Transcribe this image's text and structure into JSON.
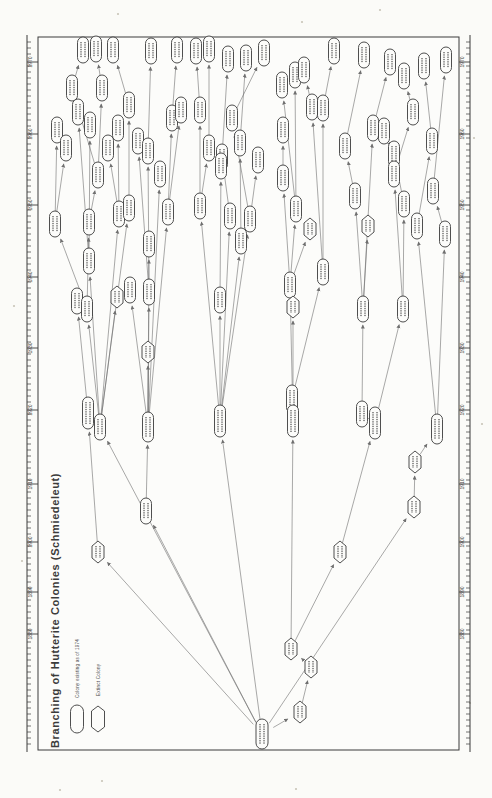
{
  "title": "Branching of Hutterite Colonies (Schmiedeleut)",
  "legend": {
    "existing": "Colony existing as of 1974",
    "extinct": "Extinct Colony"
  },
  "note": "Scanned genealogy diagram; colony names inside nodes are below legibility at this scan resolution and are rendered as micro-text marks.",
  "colors": {
    "ink": "#3b3b3b",
    "line": "#6f6f6f",
    "paper": "#fcfcfa",
    "page": "#fbfbf8",
    "speck": "#c9c5b8",
    "microtext": "#2a2a2a"
  },
  "frame": {
    "top": 37,
    "bottom": 750,
    "inner_left": 38,
    "inner_right": 459,
    "outer_left": 27,
    "outer_right": 470
  },
  "axis": {
    "minor_tick_step": 6,
    "years": [
      {
        "label": "1970",
        "y": 62
      },
      {
        "label": "1960",
        "y": 134
      },
      {
        "label": "1950",
        "y": 205
      },
      {
        "label": "1940",
        "y": 277
      },
      {
        "label": "1930",
        "y": 348
      },
      {
        "label": "1920",
        "y": 410
      },
      {
        "label": "1910",
        "y": 484
      },
      {
        "label": "1900",
        "y": 542
      },
      {
        "label": "1890",
        "y": 592
      },
      {
        "label": "1880",
        "y": 634
      }
    ]
  },
  "legend_shapes": [
    {
      "shape": "p",
      "x": 77,
      "y": 719,
      "w": 13,
      "h": 28
    },
    {
      "shape": "x",
      "x": 98,
      "y": 719,
      "w": 13,
      "h": 26
    }
  ],
  "nodes": [
    {
      "id": 1,
      "x": 83,
      "y": 50,
      "s": "p"
    },
    {
      "id": 2,
      "x": 96,
      "y": 49,
      "s": "p"
    },
    {
      "id": 3,
      "x": 113,
      "y": 50,
      "s": "p"
    },
    {
      "id": 4,
      "x": 151,
      "y": 51,
      "s": "p"
    },
    {
      "id": 5,
      "x": 177,
      "y": 50,
      "s": "p"
    },
    {
      "id": 6,
      "x": 196,
      "y": 51,
      "s": "p"
    },
    {
      "id": 7,
      "x": 209,
      "y": 49,
      "s": "p"
    },
    {
      "id": 8,
      "x": 228,
      "y": 59,
      "s": "p"
    },
    {
      "id": 9,
      "x": 246,
      "y": 58,
      "s": "p"
    },
    {
      "id": 10,
      "x": 264,
      "y": 53,
      "s": "p"
    },
    {
      "id": 11,
      "x": 334,
      "y": 51,
      "s": "p"
    },
    {
      "id": 12,
      "x": 364,
      "y": 55,
      "s": "p"
    },
    {
      "id": 13,
      "x": 390,
      "y": 62,
      "s": "p"
    },
    {
      "id": 14,
      "x": 446,
      "y": 60,
      "s": "p"
    },
    {
      "id": 15,
      "x": 424,
      "y": 66,
      "s": "p"
    },
    {
      "id": 16,
      "x": 404,
      "y": 76,
      "s": "p"
    },
    {
      "id": 17,
      "x": 72,
      "y": 88,
      "s": "p"
    },
    {
      "id": 18,
      "x": 102,
      "y": 88,
      "s": "p"
    },
    {
      "id": 19,
      "x": 78,
      "y": 112,
      "s": "p"
    },
    {
      "id": 20,
      "x": 90,
      "y": 125,
      "s": "p"
    },
    {
      "id": 21,
      "x": 57,
      "y": 130,
      "s": "p"
    },
    {
      "id": 22,
      "x": 66,
      "y": 148,
      "s": "p"
    },
    {
      "id": 23,
      "x": 129,
      "y": 105,
      "s": "p"
    },
    {
      "id": 24,
      "x": 118,
      "y": 128,
      "s": "p"
    },
    {
      "id": 25,
      "x": 108,
      "y": 148,
      "s": "p"
    },
    {
      "id": 26,
      "x": 138,
      "y": 141,
      "s": "p"
    },
    {
      "id": 27,
      "x": 148,
      "y": 151,
      "s": "p"
    },
    {
      "id": 28,
      "x": 172,
      "y": 118,
      "s": "p"
    },
    {
      "id": 29,
      "x": 181,
      "y": 110,
      "s": "p"
    },
    {
      "id": 30,
      "x": 200,
      "y": 110,
      "s": "p"
    },
    {
      "id": 31,
      "x": 209,
      "y": 148,
      "s": "p"
    },
    {
      "id": 32,
      "x": 222,
      "y": 157,
      "s": "p"
    },
    {
      "id": 33,
      "x": 232,
      "y": 118,
      "s": "p"
    },
    {
      "id": 34,
      "x": 240,
      "y": 143,
      "s": "p"
    },
    {
      "id": 35,
      "x": 282,
      "y": 85,
      "s": "p"
    },
    {
      "id": 36,
      "x": 295,
      "y": 75,
      "s": "p"
    },
    {
      "id": 37,
      "x": 304,
      "y": 70,
      "s": "p"
    },
    {
      "id": 38,
      "x": 312,
      "y": 107,
      "s": "p"
    },
    {
      "id": 39,
      "x": 323,
      "y": 108,
      "s": "p"
    },
    {
      "id": 40,
      "x": 283,
      "y": 130,
      "s": "p"
    },
    {
      "id": 41,
      "x": 345,
      "y": 146,
      "s": "p"
    },
    {
      "id": 42,
      "x": 373,
      "y": 128,
      "s": "p"
    },
    {
      "id": 43,
      "x": 384,
      "y": 131,
      "s": "p"
    },
    {
      "id": 44,
      "x": 394,
      "y": 154,
      "s": "p"
    },
    {
      "id": 45,
      "x": 413,
      "y": 112,
      "s": "p"
    },
    {
      "id": 46,
      "x": 432,
      "y": 141,
      "s": "p"
    },
    {
      "id": 47,
      "x": 98,
      "y": 175,
      "s": "p"
    },
    {
      "id": 48,
      "x": 160,
      "y": 174,
      "s": "p"
    },
    {
      "id": 49,
      "x": 221,
      "y": 166,
      "s": "p"
    },
    {
      "id": 50,
      "x": 55,
      "y": 224,
      "s": "p"
    },
    {
      "id": 51,
      "x": 89,
      "y": 222,
      "s": "p"
    },
    {
      "id": 52,
      "x": 119,
      "y": 214,
      "s": "p"
    },
    {
      "id": 53,
      "x": 129,
      "y": 208,
      "s": "p"
    },
    {
      "id": 54,
      "x": 168,
      "y": 212,
      "s": "p"
    },
    {
      "id": 55,
      "x": 200,
      "y": 206,
      "s": "p"
    },
    {
      "id": 56,
      "x": 230,
      "y": 216,
      "s": "p"
    },
    {
      "id": 57,
      "x": 250,
      "y": 219,
      "s": "p"
    },
    {
      "id": 58,
      "x": 241,
      "y": 241,
      "s": "p"
    },
    {
      "id": 59,
      "x": 149,
      "y": 244,
      "s": "p"
    },
    {
      "id": 60,
      "x": 89,
      "y": 261,
      "s": "p"
    },
    {
      "id": 61,
      "x": 258,
      "y": 160,
      "s": "p"
    },
    {
      "id": 62,
      "x": 283,
      "y": 178,
      "s": "p"
    },
    {
      "id": 63,
      "x": 296,
      "y": 209,
      "s": "p"
    },
    {
      "id": 64,
      "x": 310,
      "y": 229,
      "s": "x"
    },
    {
      "id": 65,
      "x": 355,
      "y": 196,
      "s": "p"
    },
    {
      "id": 66,
      "x": 368,
      "y": 226,
      "s": "x"
    },
    {
      "id": 67,
      "x": 394,
      "y": 174,
      "s": "p"
    },
    {
      "id": 68,
      "x": 404,
      "y": 204,
      "s": "p"
    },
    {
      "id": 69,
      "x": 417,
      "y": 226,
      "s": "p"
    },
    {
      "id": 70,
      "x": 433,
      "y": 191,
      "s": "p"
    },
    {
      "id": 71,
      "x": 445,
      "y": 234,
      "s": "p"
    },
    {
      "id": 72,
      "x": 77,
      "y": 301,
      "s": "p"
    },
    {
      "id": 73,
      "x": 87,
      "y": 309,
      "s": "p"
    },
    {
      "id": 74,
      "x": 117,
      "y": 297,
      "s": "x"
    },
    {
      "id": 75,
      "x": 130,
      "y": 290,
      "s": "p"
    },
    {
      "id": 76,
      "x": 149,
      "y": 292,
      "s": "p"
    },
    {
      "id": 77,
      "x": 220,
      "y": 300,
      "s": "p"
    },
    {
      "id": 78,
      "x": 290,
      "y": 285,
      "s": "p"
    },
    {
      "id": 79,
      "x": 293,
      "y": 307,
      "s": "x"
    },
    {
      "id": 80,
      "x": 323,
      "y": 272,
      "s": "p"
    },
    {
      "id": 81,
      "x": 363,
      "y": 309,
      "s": "p"
    },
    {
      "id": 82,
      "x": 403,
      "y": 309,
      "s": "p"
    },
    {
      "id": 83,
      "x": 148,
      "y": 352,
      "s": "x"
    },
    {
      "id": 85,
      "x": 292,
      "y": 399,
      "s": "p",
      "h": 28
    },
    {
      "id": 86,
      "x": 293,
      "y": 421,
      "s": "p",
      "h": 32
    },
    {
      "id": 87,
      "x": 88,
      "y": 413,
      "s": "p",
      "h": 32
    },
    {
      "id": 88,
      "x": 100,
      "y": 427,
      "s": "p"
    },
    {
      "id": 89,
      "x": 148,
      "y": 427,
      "s": "p",
      "h": 30
    },
    {
      "id": 90,
      "x": 220,
      "y": 421,
      "s": "p",
      "h": 32
    },
    {
      "id": 91,
      "x": 362,
      "y": 414,
      "s": "p"
    },
    {
      "id": 92,
      "x": 375,
      "y": 423,
      "s": "p",
      "h": 32
    },
    {
      "id": 93,
      "x": 437,
      "y": 429,
      "s": "p",
      "h": 30
    },
    {
      "id": 94,
      "x": 146,
      "y": 511,
      "s": "p"
    },
    {
      "id": 95,
      "x": 415,
      "y": 462,
      "s": "x"
    },
    {
      "id": 96,
      "x": 414,
      "y": 507,
      "s": "x"
    },
    {
      "id": 97,
      "x": 98,
      "y": 552,
      "s": "x"
    },
    {
      "id": 98,
      "x": 340,
      "y": 552,
      "s": "x"
    },
    {
      "id": 99,
      "x": 291,
      "y": 649,
      "s": "x"
    },
    {
      "id": 100,
      "x": 311,
      "y": 667,
      "s": "x"
    },
    {
      "id": 101,
      "x": 300,
      "y": 712,
      "s": "x"
    },
    {
      "id": 102,
      "x": 262,
      "y": 734,
      "s": "p",
      "w": 12,
      "h": 30
    }
  ],
  "edges": [
    [
      17,
      1
    ],
    [
      18,
      2
    ],
    [
      23,
      3
    ],
    [
      27,
      4
    ],
    [
      28,
      5
    ],
    [
      30,
      6
    ],
    [
      31,
      7
    ],
    [
      32,
      8
    ],
    [
      34,
      9
    ],
    [
      33,
      10
    ],
    [
      39,
      11
    ],
    [
      41,
      12
    ],
    [
      42,
      13
    ],
    [
      70,
      14
    ],
    [
      46,
      15
    ],
    [
      45,
      16
    ],
    [
      47,
      17
    ],
    [
      47,
      18
    ],
    [
      60,
      19
    ],
    [
      60,
      20
    ],
    [
      50,
      21
    ],
    [
      50,
      22
    ],
    [
      53,
      23
    ],
    [
      52,
      24
    ],
    [
      52,
      25
    ],
    [
      76,
      26
    ],
    [
      76,
      27
    ],
    [
      54,
      28
    ],
    [
      54,
      29
    ],
    [
      55,
      30
    ],
    [
      55,
      31
    ],
    [
      56,
      32
    ],
    [
      57,
      33
    ],
    [
      58,
      34
    ],
    [
      63,
      35
    ],
    [
      63,
      36
    ],
    [
      38,
      37
    ],
    [
      80,
      38
    ],
    [
      80,
      39
    ],
    [
      62,
      40
    ],
    [
      65,
      41
    ],
    [
      81,
      42
    ],
    [
      44,
      43
    ],
    [
      68,
      44
    ],
    [
      67,
      45
    ],
    [
      69,
      46
    ],
    [
      51,
      47
    ],
    [
      89,
      48
    ],
    [
      77,
      49
    ],
    [
      73,
      50
    ],
    [
      73,
      51
    ],
    [
      88,
      52
    ],
    [
      88,
      53
    ],
    [
      89,
      54
    ],
    [
      90,
      55
    ],
    [
      90,
      56
    ],
    [
      90,
      57
    ],
    [
      90,
      58
    ],
    [
      89,
      59
    ],
    [
      88,
      60
    ],
    [
      57,
      61
    ],
    [
      78,
      62
    ],
    [
      78,
      63
    ],
    [
      78,
      64
    ],
    [
      81,
      65
    ],
    [
      81,
      66
    ],
    [
      82,
      67
    ],
    [
      82,
      68
    ],
    [
      93,
      69
    ],
    [
      71,
      70
    ],
    [
      93,
      71
    ],
    [
      87,
      72
    ],
    [
      88,
      73
    ],
    [
      88,
      74
    ],
    [
      89,
      75
    ],
    [
      89,
      76
    ],
    [
      90,
      77
    ],
    [
      86,
      78
    ],
    [
      86,
      79
    ],
    [
      85,
      80
    ],
    [
      91,
      81
    ],
    [
      92,
      82
    ],
    [
      89,
      83
    ],
    [
      86,
      85
    ],
    [
      99,
      86
    ],
    [
      97,
      87
    ],
    [
      102,
      88
    ],
    [
      94,
      89
    ],
    [
      102,
      90
    ],
    [
      92,
      91
    ],
    [
      98,
      92
    ],
    [
      95,
      93
    ],
    [
      102,
      94
    ],
    [
      96,
      95
    ],
    [
      102,
      96
    ],
    [
      102,
      97
    ],
    [
      99,
      98
    ],
    [
      100,
      99
    ],
    [
      101,
      100
    ],
    [
      102,
      101
    ]
  ],
  "specks": [
    [
      118,
      14
    ],
    [
      302,
      22
    ],
    [
      474,
      138
    ],
    [
      14,
      306
    ],
    [
      482,
      424
    ],
    [
      102,
      781
    ],
    [
      296,
      789
    ],
    [
      470,
      703
    ],
    [
      22,
      561
    ],
    [
      243,
      419
    ],
    [
      380,
      10
    ],
    [
      60,
      790
    ]
  ]
}
